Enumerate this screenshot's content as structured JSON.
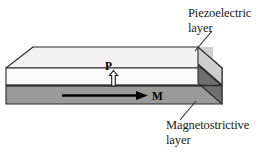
{
  "figure": {
    "type": "layered-composite-diagram",
    "labels": {
      "piezoelectric": {
        "line1": "Piezoelectric",
        "line2": "layer"
      },
      "magnetostrictive": {
        "line1": "Magnetostrictive",
        "line2": "layer"
      }
    },
    "vectors": {
      "polarization": {
        "symbol": "P",
        "direction": "up",
        "style": "hollow-outline-arrow",
        "layer": "piezoelectric"
      },
      "magnetization": {
        "symbol": "M",
        "direction": "right",
        "style": "solid-filled-arrow",
        "layer": "magnetostrictive"
      }
    },
    "colors": {
      "top_face": "#f2f2f2",
      "piezo_front_face": "#fbfbfb",
      "piezo_end_face": "#cfcfcf",
      "magneto_front_face": "#9a9a9a",
      "magneto_end_face": "#6f6f6f",
      "outline": "#2b2b2b",
      "arrow_fill": "#000000",
      "arrow_hollow_fill": "#ffffff",
      "text": "#1a1a1a",
      "background": "#ffffff"
    },
    "leader_lines": {
      "piezoelectric": "from top face right corner up-right to label",
      "magnetostrictive": "from magnetostrictive bottom right down-left to label"
    }
  }
}
